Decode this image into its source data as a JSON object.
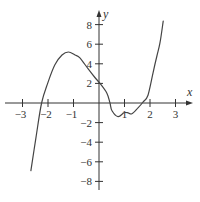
{
  "chart_data": {
    "type": "line",
    "title": "",
    "xlabel": "x",
    "ylabel": "y",
    "xlim": [
      -3.7,
      3.6
    ],
    "ylim": [
      -8.9,
      9.3
    ],
    "grid": false,
    "legend": null,
    "x_ticks": [
      -3,
      -2,
      -1,
      1,
      2,
      3
    ],
    "x_tick_labels": [
      "−3",
      "−2",
      "−1",
      "1",
      "2",
      "3"
    ],
    "y_ticks": [
      8,
      6,
      4,
      2,
      -2,
      -4,
      -6,
      -8
    ],
    "y_tick_labels": [
      "8",
      "6",
      "4",
      "2",
      "−2",
      "−4",
      "−6",
      "−8"
    ],
    "series": [
      {
        "name": "f(x)",
        "color": "#444444",
        "x": [
          -2.67,
          -2.47,
          -2.25,
          -2.0,
          -1.73,
          -1.45,
          -1.2,
          -0.94,
          -0.75,
          -0.43,
          -0.16,
          0.04,
          0.31,
          0.43,
          0.51,
          0.75,
          0.98,
          1.14,
          1.29,
          1.53,
          1.73,
          1.92,
          2.12,
          2.27,
          2.39,
          2.51,
          2.51
        ],
        "y": [
          -6.9,
          -3.5,
          0.0,
          2.1,
          3.9,
          4.9,
          5.2,
          4.9,
          4.6,
          3.5,
          2.6,
          2.0,
          1.0,
          0.0,
          -0.8,
          -1.4,
          -1.0,
          -1.0,
          -1.1,
          -0.5,
          0.1,
          0.8,
          3.1,
          4.8,
          6.1,
          8.2,
          8.2
        ]
      }
    ],
    "features": {
      "local_max": [
        -1.2,
        5.2
      ],
      "local_min": [
        1.14,
        -1.0
      ],
      "x_intercepts": [
        -2.25,
        0.35,
        1.75
      ],
      "y_intercept": 2.0
    }
  }
}
